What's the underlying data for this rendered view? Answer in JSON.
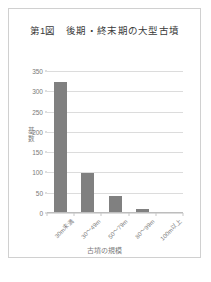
{
  "figure": {
    "title": "第1図　後期・終末期の大型古墳",
    "border_color": "#d0d0d0",
    "background": "#ffffff"
  },
  "chart_data": {
    "type": "bar",
    "title": "第1図　後期・終末期の大型古墳",
    "xlabel": "古墳の規模",
    "ylabel": "基数",
    "categories": [
      "30m未満",
      "30〜49m",
      "50〜79m",
      "80〜99m",
      "100m以上"
    ],
    "values": [
      320,
      97,
      40,
      8,
      0
    ],
    "ylim": [
      0,
      350
    ],
    "yticks": [
      0,
      50,
      100,
      150,
      200,
      250,
      300,
      350
    ],
    "ytick_labels": [
      "0",
      "50",
      "100",
      "150",
      "200",
      "250",
      "300",
      "350"
    ],
    "grid": true,
    "legend": false,
    "bar_color": "#808080",
    "gridline_color": "#dcdcdc",
    "axis_color": "#bdbdbd",
    "tick_label_color": "#7a7a7a"
  }
}
